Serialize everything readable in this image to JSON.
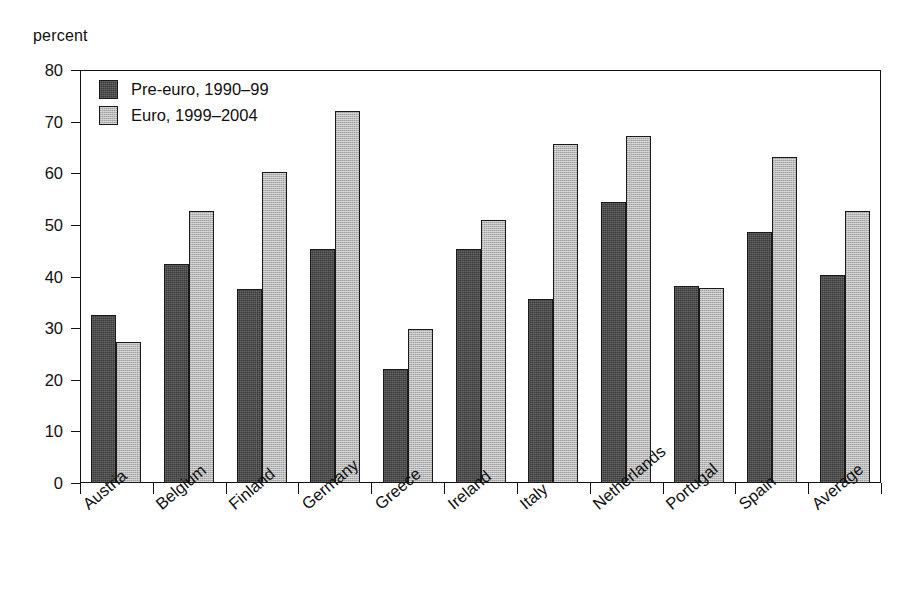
{
  "chart_data": {
    "type": "bar",
    "title": "",
    "subtitle": "",
    "xlabel": "",
    "ylabel": "percent",
    "ylim": [
      0,
      80
    ],
    "yticks": [
      0,
      10,
      20,
      30,
      40,
      50,
      60,
      70,
      80
    ],
    "ytick_labels": [
      "0",
      "10",
      "20",
      "30",
      "40",
      "50",
      "60",
      "70",
      "80"
    ],
    "grid": false,
    "legend_position": "top-left inside plot",
    "categories": [
      "Austria",
      "Belgium",
      "Finland",
      "Germany",
      "Greece",
      "Ireland",
      "Italy",
      "Netherlands",
      "Portugal",
      "Spain",
      "Average"
    ],
    "series": [
      {
        "name": "Pre-euro, 1990–99",
        "color": "#3a3a3a",
        "values": [
          32.5,
          42.4,
          37.5,
          45.3,
          22.1,
          45.3,
          35.6,
          54.5,
          38.2,
          48.7,
          40.2
        ]
      },
      {
        "name": "Euro, 1999–2004",
        "color": "#b9b9b9",
        "values": [
          27.4,
          52.6,
          60.3,
          72.0,
          29.8,
          51.0,
          65.7,
          67.2,
          37.8,
          63.2,
          52.6
        ]
      }
    ],
    "annotations": []
  },
  "legend": {
    "items": [
      {
        "label": "Pre-euro, 1990–99",
        "swatch": "dark"
      },
      {
        "label": "Euro, 1999–2004",
        "swatch": "light"
      }
    ]
  }
}
